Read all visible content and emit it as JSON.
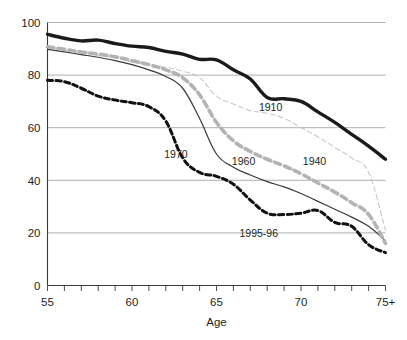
{
  "chart_data": {
    "type": "line",
    "title": "",
    "subtitle": "",
    "xlabel": "Age",
    "ylabel": "",
    "xlim": [
      55,
      75
    ],
    "ylim": [
      0,
      100
    ],
    "grid": "horizontal",
    "legend_position": "inline-labels",
    "x": [
      55,
      56,
      57,
      58,
      59,
      60,
      61,
      62,
      63,
      64,
      65,
      66,
      67,
      68,
      69,
      70,
      71,
      72,
      73,
      74,
      75
    ],
    "x_tick_labels": [
      "55",
      "",
      "",
      "",
      "",
      "60",
      "",
      "",
      "",
      "",
      "65",
      "",
      "",
      "",
      "",
      "70",
      "",
      "",
      "",
      "",
      "75+"
    ],
    "x_major_ticks": [
      "55",
      "60",
      "65",
      "70",
      "75+"
    ],
    "y_tick_labels": [
      "0",
      "20",
      "40",
      "60",
      "80",
      "100"
    ],
    "y_ticks": [
      0,
      20,
      40,
      60,
      80,
      100
    ],
    "series": [
      {
        "name": "1910",
        "label": "1910",
        "color": "#1a1a1a",
        "style": "solid",
        "width": 3.4,
        "label_x": 68.2,
        "label_y": 66.5,
        "values": [
          95.5,
          94.0,
          93.0,
          93.3,
          92.0,
          91.0,
          90.5,
          89.0,
          88.0,
          86.0,
          85.8,
          82.0,
          78.5,
          71.5,
          71.0,
          70.0,
          66.0,
          62.0,
          57.5,
          53.0,
          48.0
        ]
      },
      {
        "name": "1940",
        "label": "1940",
        "color": "#c9c9c9",
        "style": "dashed-thin",
        "width": 1.1,
        "label_x": 70.8,
        "label_y": 46.0,
        "values": [
          90.5,
          89.5,
          88.5,
          87.5,
          86.5,
          85.0,
          84.0,
          83.0,
          81.5,
          79.0,
          72.0,
          69.0,
          66.5,
          65.5,
          63.5,
          60.0,
          56.5,
          52.5,
          48.5,
          43.0,
          21.0
        ]
      },
      {
        "name": "1960",
        "label": "1960",
        "color": "#b3b3b3",
        "style": "dashed-thick",
        "width": 3.6,
        "label_x": 66.6,
        "label_y": 46.0,
        "values": [
          90.8,
          89.8,
          88.8,
          88.0,
          87.0,
          85.5,
          84.0,
          82.0,
          79.0,
          72.5,
          62.0,
          55.0,
          51.0,
          48.0,
          45.5,
          42.5,
          39.0,
          35.5,
          31.5,
          27.0,
          16.0
        ]
      },
      {
        "name": "1970",
        "label": "1970",
        "color": "#3a3a3a",
        "style": "solid-thin",
        "width": 1.2,
        "label_x": 62.6,
        "label_y": 48.5,
        "values": [
          89.8,
          88.8,
          87.8,
          86.8,
          85.5,
          84.0,
          82.0,
          79.5,
          75.0,
          63.5,
          50.0,
          45.0,
          42.0,
          39.5,
          37.5,
          35.0,
          32.0,
          29.0,
          26.0,
          22.5,
          17.0
        ]
      },
      {
        "name": "1995-96",
        "label": "1995-96",
        "color": "#111111",
        "style": "dashed-bold",
        "width": 3.0,
        "label_x": 67.5,
        "label_y": 18.5,
        "values": [
          78.0,
          77.5,
          75.0,
          72.0,
          70.5,
          69.5,
          68.0,
          62.5,
          48.5,
          43.0,
          41.5,
          38.5,
          32.5,
          27.5,
          27.0,
          27.5,
          28.5,
          24.0,
          22.5,
          15.5,
          12.5
        ]
      }
    ]
  }
}
